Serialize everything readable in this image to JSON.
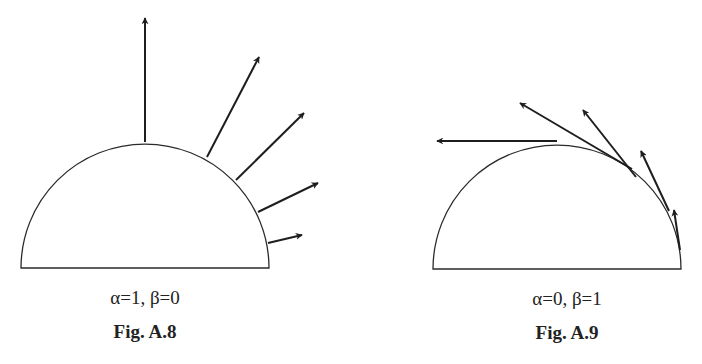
{
  "figures": [
    {
      "id": "A.8",
      "params_label": "α=1, β=0",
      "fig_label": "Fig. A.8",
      "description": "Radiation directed along surface normals (alpha=1, beta=0)",
      "semicircle": {
        "cx": 145,
        "cy": 268,
        "r": 124
      },
      "arrows": [
        {
          "x1": 145,
          "y1": 142,
          "x2": 145,
          "y2": 18
        },
        {
          "x1": 207,
          "y1": 157,
          "x2": 259,
          "y2": 57
        },
        {
          "x1": 236,
          "y1": 180,
          "x2": 304,
          "y2": 113
        },
        {
          "x1": 258,
          "y1": 212,
          "x2": 318,
          "y2": 183
        },
        {
          "x1": 268,
          "y1": 243,
          "x2": 302,
          "y2": 235
        }
      ]
    },
    {
      "id": "A.9",
      "params_label": "α=0, β=1",
      "fig_label": "Fig. A.9",
      "description": "Radiation directed along surface tangents (alpha=0, beta=1)",
      "semicircle": {
        "cx": 557,
        "cy": 269,
        "r": 124
      },
      "arrows": [
        {
          "x1": 557,
          "y1": 141,
          "x2": 437,
          "y2": 141
        },
        {
          "x1": 632,
          "y1": 169,
          "x2": 520,
          "y2": 103
        },
        {
          "x1": 636,
          "y1": 177,
          "x2": 583,
          "y2": 110
        },
        {
          "x1": 669,
          "y1": 211,
          "x2": 641,
          "y2": 151
        },
        {
          "x1": 680,
          "y1": 250,
          "x2": 674,
          "y2": 210
        }
      ]
    }
  ],
  "colors": {
    "stroke": "#2a2a2a",
    "arrow": "#1e1e1e",
    "background": "#ffffff"
  }
}
